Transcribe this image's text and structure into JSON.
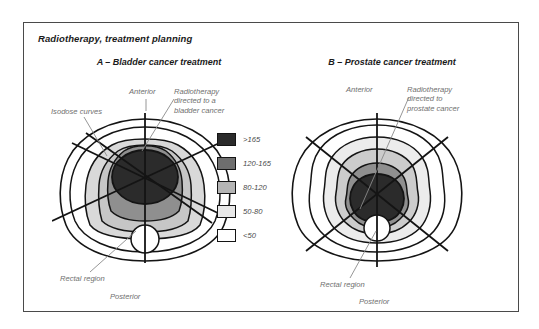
{
  "figure": {
    "title": "Radiotherapy, treatment planning",
    "frame_color": "#4a4a4a",
    "background": "#ffffff"
  },
  "panels": [
    {
      "id": "a",
      "heading": "A – Bladder cancer treatment",
      "annotations": {
        "anterior": "Anterior",
        "posterior": "Posterior",
        "isodose_curves": "Isodose curves",
        "beam_target_line1": "Radiotherapy",
        "beam_target_line2": "directed to a",
        "beam_target_line3": "bladder cancer",
        "rectal_region": "Rectal region"
      }
    },
    {
      "id": "b",
      "heading": "B – Prostate cancer treatment",
      "annotations": {
        "anterior": "Anterior",
        "posterior": "Posterior",
        "beam_target_line1": "Radiotherapy",
        "beam_target_line2": "directed to",
        "beam_target_line3": "prostate cancer",
        "rectal_region": "Rectal region"
      }
    }
  ],
  "legend": {
    "items": [
      {
        "label": ">165",
        "color": "#2b2b2b"
      },
      {
        "label": "120-165",
        "color": "#6e6e6e"
      },
      {
        "label": "80-120",
        "color": "#b4b4b4"
      },
      {
        "label": "50-80",
        "color": "#e8e8e8"
      },
      {
        "label": "<50",
        "color": "#ffffff"
      }
    ]
  },
  "colors": {
    "outline": "#141414",
    "beam": "#141414",
    "leader": "#8a8a8a",
    "label_text": "#6f6f6f",
    "heading_text": "#1a1a1a"
  }
}
